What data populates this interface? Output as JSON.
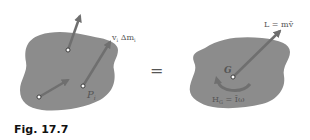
{
  "figure": {
    "caption": "Fig.  17.7",
    "left_body": {
      "particle_label": "P",
      "particle_subscript": "i",
      "momentum_label": "v",
      "momentum_label_sub": "i",
      "momentum_label_rest": " Δm",
      "momentum_label_rest_sub": "i"
    },
    "equals": "=",
    "right_body": {
      "center_label": "G",
      "linear_momentum_label": "L = mv̄",
      "angular_momentum_label": "H",
      "angular_momentum_sub": "G",
      "angular_momentum_rest": " = Īω"
    }
  },
  "colors": {
    "body_fill": "#8c8c8c",
    "arrow": "#6f6f6f",
    "text": "#555555"
  }
}
